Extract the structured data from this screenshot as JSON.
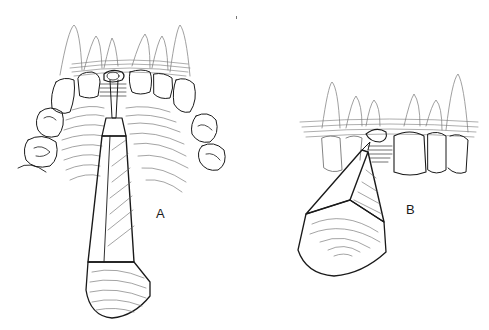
{
  "figure": {
    "panels": [
      {
        "id": "A",
        "label": "A",
        "description": "Upper arch occlusal view with elevator instrument positioned at missing central incisor site"
      },
      {
        "id": "B",
        "label": "B",
        "description": "Lateral view of anterior teeth with elevator instrument applied at extraction site"
      }
    ],
    "colors": {
      "line": "#1a1a1a",
      "hatch": "#555555",
      "background": "#ffffff"
    }
  }
}
